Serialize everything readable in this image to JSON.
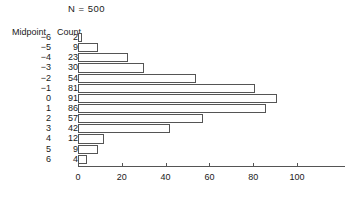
{
  "chart_data": {
    "type": "bar",
    "orientation": "horizontal",
    "title": "N = 500",
    "xlabel": "",
    "ylabel": "",
    "categories": [
      "-6",
      "-5",
      "-4",
      "-3",
      "-2",
      "-1",
      "0",
      "1",
      "2",
      "3",
      "4",
      "5",
      "6"
    ],
    "values": [
      2,
      9,
      23,
      30,
      54,
      81,
      91,
      86,
      57,
      42,
      12,
      9,
      4
    ],
    "xlim": [
      0,
      100
    ],
    "xticks": [
      0,
      20,
      40,
      60,
      80,
      100
    ],
    "xtick_labels": [
      "0",
      "20",
      "40",
      "60",
      "80",
      "100"
    ],
    "grid": false,
    "legend": false,
    "bar_fill_color": "#ffffff",
    "bar_edge_color": "#555555",
    "text_color": "#1a1a1a"
  },
  "table": {
    "headers": {
      "midpoint": "Midpoint",
      "count": "Count"
    },
    "rows": [
      {
        "midpoint": "−6",
        "count": "2"
      },
      {
        "midpoint": "−5",
        "count": "9"
      },
      {
        "midpoint": "−4",
        "count": "23"
      },
      {
        "midpoint": "−3",
        "count": "30"
      },
      {
        "midpoint": "−2",
        "count": "54"
      },
      {
        "midpoint": "−1",
        "count": "81"
      },
      {
        "midpoint": "0",
        "count": "91"
      },
      {
        "midpoint": "1",
        "count": "86"
      },
      {
        "midpoint": "2",
        "count": "57"
      },
      {
        "midpoint": "3",
        "count": "42"
      },
      {
        "midpoint": "4",
        "count": "12"
      },
      {
        "midpoint": "5",
        "count": "9"
      },
      {
        "midpoint": "6",
        "count": "4"
      }
    ]
  }
}
